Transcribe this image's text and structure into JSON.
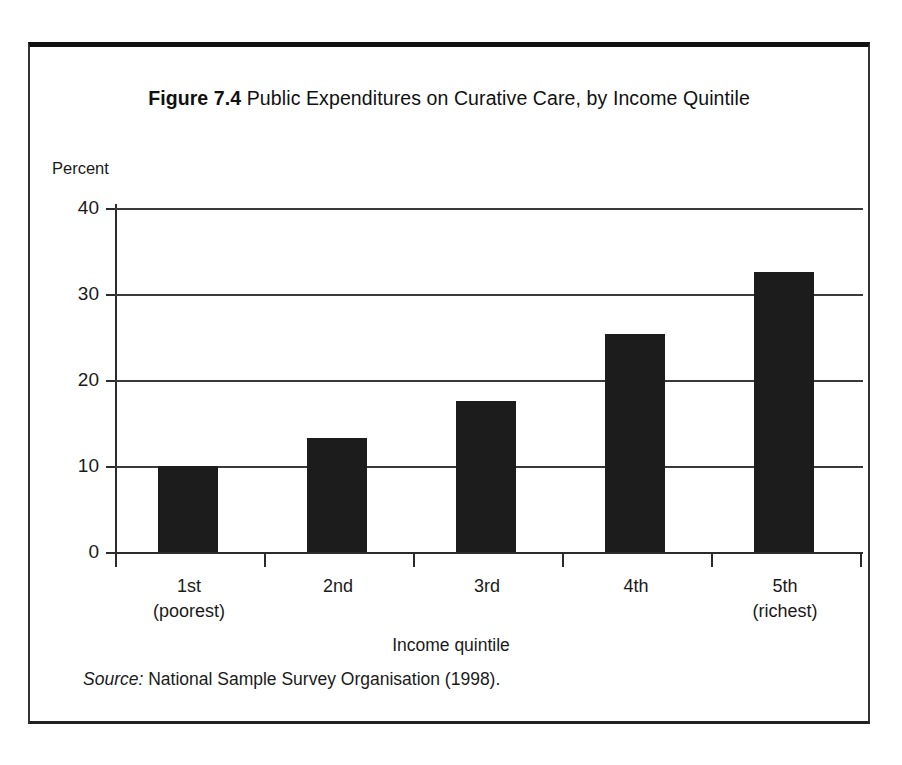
{
  "figure": {
    "number_label": "Figure 7.4",
    "title_text": " Public Expenditures on Curative Care, by Income Quintile",
    "source_label": "Source:",
    "source_text": " National Sample Survey Organisation (1998)."
  },
  "chart_data": {
    "type": "bar",
    "title": "Figure 7.4 Public Expenditures on Curative Care, by Income Quintile",
    "xlabel": "Income quintile",
    "ylabel": "Percent",
    "categories": [
      "1st",
      "2nd",
      "3rd",
      "4th",
      "5th"
    ],
    "category_sublabels": [
      "(poorest)",
      "",
      "",
      "",
      "(richest)"
    ],
    "values": [
      10.0,
      13.3,
      17.6,
      25.4,
      32.6
    ],
    "ylim": [
      0,
      40
    ],
    "yticks": [
      0,
      10,
      20,
      30,
      40
    ],
    "ytick_labels": [
      "0",
      "10",
      "20",
      "30",
      "40"
    ],
    "grid": true,
    "legend": "none",
    "bar_color": "#1c1c1c",
    "background_color": "#ffffff",
    "source": "Source: National Sample Survey Organisation (1998)."
  }
}
